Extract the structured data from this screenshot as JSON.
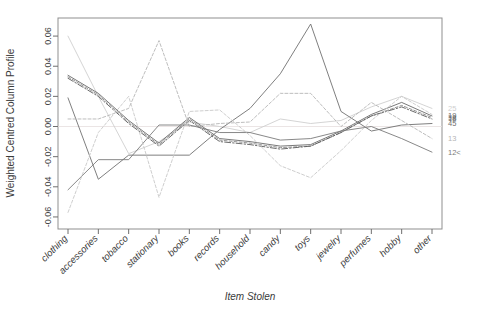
{
  "chart_data": {
    "type": "line",
    "title": "",
    "xlabel": "Item Stolen",
    "ylabel": "Weighted Centred Column Profile",
    "categories": [
      "clothing",
      "accessories",
      "tobacco",
      "stationary",
      "books",
      "records",
      "household",
      "candy",
      "toys",
      "jewelry",
      "perfumes",
      "hobby",
      "other"
    ],
    "ylim": [
      -0.068,
      0.072
    ],
    "yticks": [
      "0.06",
      "0.04",
      "0.02",
      "0.00",
      "-0.02",
      "-0.04",
      "-0.06"
    ],
    "ytick_values": [
      0.06,
      0.04,
      0.02,
      0.0,
      -0.02,
      -0.04,
      -0.06
    ],
    "grid": false,
    "legend_position": "right",
    "zero_reference_line": 0.0,
    "series": [
      {
        "name": "25",
        "label": "25",
        "color": "#cfcfcf",
        "dash": "none",
        "values": [
          0.06,
          0.02,
          -0.018,
          -0.01,
          0.003,
          0.0,
          -0.004,
          0.005,
          0.002,
          0.004,
          0.013,
          0.02,
          0.012
        ]
      },
      {
        "name": "19",
        "label": "19",
        "color": "#6a6a6a",
        "dash": "none",
        "values": [
          0.034,
          0.022,
          0.004,
          -0.011,
          0.006,
          -0.008,
          -0.01,
          -0.013,
          -0.012,
          -0.003,
          0.008,
          0.016,
          0.007
        ]
      },
      {
        "name": "38",
        "label": "38",
        "color": "#8a8a8a",
        "dash": "3,2",
        "values": [
          0.033,
          0.021,
          0.003,
          -0.012,
          0.005,
          -0.009,
          -0.011,
          -0.014,
          -0.013,
          -0.004,
          0.007,
          0.014,
          0.006
        ]
      },
      {
        "name": "18",
        "label": "18",
        "color": "#5a5a5a",
        "dash": "6,2,1.5,2",
        "values": [
          0.032,
          0.02,
          0.002,
          -0.013,
          0.004,
          -0.01,
          -0.012,
          -0.015,
          -0.013,
          -0.004,
          0.007,
          0.013,
          0.005
        ]
      },
      {
        "name": "45",
        "label": "45",
        "color": "#707070",
        "dash": "none",
        "values": [
          0.019,
          -0.035,
          -0.019,
          -0.019,
          -0.019,
          -0.002,
          0.012,
          0.035,
          0.068,
          0.01,
          -0.003,
          0.001,
          0.002
        ]
      },
      {
        "name": "13",
        "label": "13",
        "color": "#b5b5b5",
        "dash": "3,2",
        "values": [
          0.005,
          0.005,
          0.012,
          0.057,
          0.0,
          0.002,
          0.003,
          0.022,
          0.022,
          0.0,
          0.016,
          0.004,
          -0.008
        ]
      },
      {
        "name": "12<",
        "label": "12<",
        "color": "#7a7a7a",
        "dash": "none",
        "values": [
          -0.042,
          -0.022,
          -0.022,
          0.001,
          0.001,
          -0.004,
          -0.004,
          -0.009,
          -0.008,
          -0.003,
          0.0,
          -0.008,
          -0.017
        ]
      },
      {
        "name": "lower-dashed",
        "label": "",
        "color": "#c8c8c8",
        "dash": "3,2",
        "values": [
          -0.057,
          -0.004,
          0.02,
          -0.047,
          0.01,
          0.011,
          -0.006,
          -0.026,
          -0.034,
          -0.016,
          0.004,
          0.02,
          0.008
        ]
      }
    ]
  },
  "axes": {
    "y_title": "Weighted Centred Column Profile",
    "x_title": "Item Stolen"
  }
}
